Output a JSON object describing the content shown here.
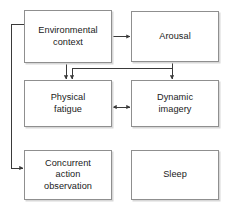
{
  "diagram": {
    "background_color": "#ffffff",
    "box_border_color": "#8f8f8f",
    "box_fill_color": "#ffffff",
    "box_shadow_color": "#d8d8d8",
    "connector_color": "#3a3a3a",
    "nodes": [
      {
        "id": "environmental-context",
        "label": "Environmental\ncontext",
        "row": "top",
        "column": "left"
      },
      {
        "id": "arousal",
        "label": "Arousal",
        "row": "top",
        "column": "right"
      },
      {
        "id": "physical-fatigue",
        "label": "Physical\nfatigue",
        "row": "middle",
        "column": "left"
      },
      {
        "id": "dynamic-imagery",
        "label": "Dynamic\nimagery",
        "row": "middle",
        "column": "right"
      },
      {
        "id": "concurrent-action",
        "label": "Concurrent\naction\nobservation",
        "row": "bottom",
        "column": "left"
      },
      {
        "id": "sleep",
        "label": "Sleep",
        "row": "bottom",
        "column": "right"
      }
    ],
    "connectors": [
      {
        "id": "environmental-context-to-arousal",
        "from": "environmental-context",
        "to": "arousal",
        "direction": "one-way"
      },
      {
        "id": "environmental-context-to-physical-fatigue",
        "from": "environmental-context",
        "to": "physical-fatigue",
        "direction": "one-way"
      },
      {
        "id": "environmental-context-to-concurrent-action",
        "from": "environmental-context",
        "to": "concurrent-action",
        "direction": "one-way"
      },
      {
        "id": "arousal-to-dynamic-imagery",
        "from": "arousal",
        "to": "dynamic-imagery",
        "direction": "one-way"
      },
      {
        "id": "arousal-to-physical-fatigue",
        "from": "arousal",
        "to": "physical-fatigue",
        "direction": "one-way"
      },
      {
        "id": "physical-fatigue-to-dynamic-imagery",
        "from": "physical-fatigue",
        "to": "dynamic-imagery",
        "direction": "two-way"
      }
    ]
  }
}
